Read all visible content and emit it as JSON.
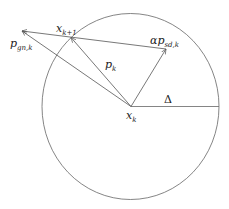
{
  "diagram": {
    "colors": {
      "stroke": "#555555",
      "text": "#222222",
      "background": "#ffffff"
    },
    "trust_region": {
      "cx": 130.5,
      "cy": 106.5,
      "rx": 88.5,
      "ry": 93,
      "radius_label": "Δ"
    },
    "points": {
      "x_k": {
        "x": 131,
        "y": 106.5
      },
      "x_k1": {
        "x": 71,
        "y": 37.5
      },
      "p_gn_tip": {
        "x": 22,
        "y": 31
      },
      "p_sd_tip": {
        "x": 166,
        "y": 49
      },
      "radius_end": {
        "x": 219,
        "y": 106.5
      }
    },
    "labels": {
      "x_k": {
        "main": "x",
        "sub": "k"
      },
      "x_k1": {
        "main": "x",
        "sub": "k+1"
      },
      "p_k": {
        "main": "p",
        "sub": "k"
      },
      "p_gn": {
        "main": "p",
        "sub": "gn,k"
      },
      "p_sd": {
        "main": "αp",
        "sub": "sd,k"
      },
      "delta": "Δ"
    }
  }
}
